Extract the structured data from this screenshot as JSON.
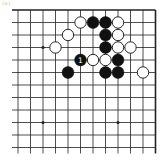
{
  "diagram": {
    "label": "(a)",
    "board": {
      "type": "go-board-corner",
      "corner": "top-right",
      "columns": 12,
      "rows": 12,
      "origin_x": 18,
      "origin_y": 10,
      "spacing_x": 12.5,
      "spacing_y": 12.5,
      "line_color": "#222222",
      "background": "#ffffff"
    },
    "star_points": [
      {
        "col": 2,
        "row": 3
      },
      {
        "col": 2,
        "row": 9
      },
      {
        "col": 8,
        "row": 9
      }
    ],
    "stones": [
      {
        "color": "white",
        "col": 5,
        "row": 1
      },
      {
        "color": "black",
        "col": 6,
        "row": 1
      },
      {
        "color": "black",
        "col": 7,
        "row": 1
      },
      {
        "color": "white",
        "col": 8,
        "row": 1
      },
      {
        "color": "white",
        "col": 4,
        "row": 2
      },
      {
        "color": "black",
        "col": 7,
        "row": 2
      },
      {
        "color": "white",
        "col": 8,
        "row": 2
      },
      {
        "color": "white",
        "col": 3,
        "row": 3
      },
      {
        "color": "black",
        "col": 7,
        "row": 3
      },
      {
        "color": "white",
        "col": 8,
        "row": 3
      },
      {
        "color": "white",
        "col": 9,
        "row": 3
      },
      {
        "color": "black",
        "col": 5,
        "row": 4,
        "mark": "1"
      },
      {
        "color": "white",
        "col": 6,
        "row": 4
      },
      {
        "color": "white",
        "col": 7,
        "row": 4
      },
      {
        "color": "black",
        "col": 8,
        "row": 4
      },
      {
        "color": "black",
        "col": 4,
        "row": 5
      },
      {
        "color": "black",
        "col": 7,
        "row": 5
      },
      {
        "color": "black",
        "col": 8,
        "row": 5
      },
      {
        "color": "white",
        "col": 10,
        "row": 5
      }
    ]
  }
}
